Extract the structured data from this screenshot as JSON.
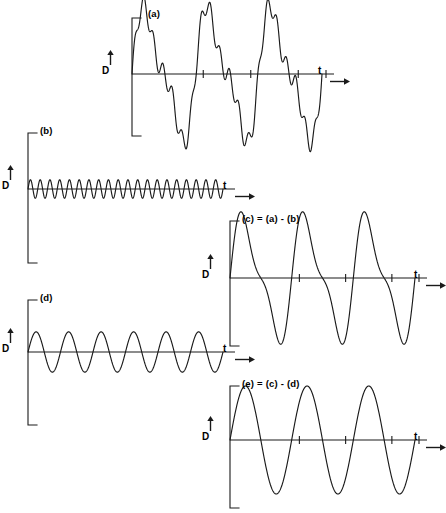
{
  "figure": {
    "type": "waveform-decomposition",
    "background_color": "#ffffff",
    "line_color": "#1a1a1a",
    "panel_count": 5
  },
  "axis_labels": {
    "vertical": "D",
    "horizontal": "t",
    "vertical_arrow": "up-arrow",
    "horizontal_arrow": "right-arrow"
  },
  "panels": [
    {
      "id": "a",
      "label": "(a)",
      "d_label": "D",
      "t_label": "t",
      "tick_count": 3
    },
    {
      "id": "b",
      "label": "(b)",
      "d_label": "D",
      "t_label": "t",
      "tick_count": 0
    },
    {
      "id": "c",
      "label": "(c) = (a) - (b)",
      "d_label": "D",
      "t_label": "t",
      "tick_count": 3
    },
    {
      "id": "d",
      "label": "(d)",
      "d_label": "D",
      "t_label": "t",
      "tick_count": 0
    },
    {
      "id": "e",
      "label": "(e) = (c) - (d)",
      "d_label": "D",
      "t_label": "t",
      "tick_count": 3
    }
  ],
  "chart_data": {
    "type": "line",
    "title": "",
    "xlabel": "t",
    "ylabel": "D",
    "grid": false,
    "legend": "none",
    "subplots": [
      {
        "id": "a",
        "title": "(a)",
        "description": "Composite waveform: sum of three sinusoidal components",
        "components": [
          {
            "cycles": 3,
            "amplitude": 1.0,
            "phase": 0.0
          },
          {
            "cycles": 6,
            "amplitude": 0.36,
            "phase": 0.0
          },
          {
            "cycles": 20,
            "amplitude": 0.16,
            "phase": 0.0
          }
        ],
        "amplitude_scale": 1.0,
        "xlim": [
          0,
          1
        ],
        "ylim": [
          -1.6,
          1.6
        ]
      },
      {
        "id": "b",
        "title": "(b)",
        "description": "High frequency component removed from (a)",
        "components": [
          {
            "cycles": 20,
            "amplitude": 0.16,
            "phase": 0.0
          }
        ],
        "amplitude_scale": 1.0,
        "xlim": [
          0,
          1
        ],
        "ylim": [
          -1.6,
          1.6
        ]
      },
      {
        "id": "c",
        "title": "(c) = (a) - (b)",
        "description": "Residual after subtracting high frequency component",
        "components": [
          {
            "cycles": 3,
            "amplitude": 1.0,
            "phase": 0.0
          },
          {
            "cycles": 6,
            "amplitude": 0.36,
            "phase": 0.0
          }
        ],
        "amplitude_scale": 1.0,
        "xlim": [
          0,
          1
        ],
        "ylim": [
          -1.6,
          1.6
        ]
      },
      {
        "id": "d",
        "title": "(d)",
        "description": "Medium frequency component removed from (c)",
        "components": [
          {
            "cycles": 6,
            "amplitude": 0.36,
            "phase": 0.0
          }
        ],
        "amplitude_scale": 1.0,
        "xlim": [
          0,
          1
        ],
        "ylim": [
          -1.6,
          1.6
        ]
      },
      {
        "id": "e",
        "title": "(e) = (c) - (d)",
        "description": "Final residual: pure low frequency sinusoid",
        "components": [
          {
            "cycles": 3,
            "amplitude": 1.0,
            "phase": 0.0
          }
        ],
        "amplitude_scale": 1.0,
        "xlim": [
          0,
          1
        ],
        "ylim": [
          -1.6,
          1.6
        ]
      }
    ]
  },
  "geometry": {
    "panels": [
      {
        "id": "a",
        "left": 118,
        "top": 8,
        "width": 230,
        "height": 130,
        "axis_x": 14,
        "baseline_y": 66,
        "plot_width": 190,
        "bracket_top": 10,
        "bracket_bottom": 128,
        "bracket_tick": 9,
        "amp_px": 58,
        "label_left": 30,
        "label_top": 0,
        "d_left": -16,
        "d_top": 58,
        "arrow_left": -12,
        "arrow_top": 42,
        "t_left": 200,
        "t_top": 58,
        "t_arrow_left": 212,
        "t_arrow_top": 64
      },
      {
        "id": "b",
        "left": 18,
        "top": 125,
        "width": 230,
        "height": 140,
        "axis_x": 10,
        "baseline_y": 64,
        "plot_width": 195,
        "bracket_top": 8,
        "bracket_bottom": 138,
        "bracket_tick": 9,
        "amp_px": 58,
        "label_left": 22,
        "label_top": 0,
        "d_left": -16,
        "d_top": 56,
        "arrow_left": -12,
        "arrow_top": 40,
        "t_left": 205,
        "t_top": 56,
        "t_arrow_left": 217,
        "t_arrow_top": 62
      },
      {
        "id": "c",
        "left": 218,
        "top": 213,
        "width": 225,
        "height": 135,
        "axis_x": 12,
        "baseline_y": 65,
        "plot_width": 185,
        "bracket_top": 8,
        "bracket_bottom": 133,
        "bracket_tick": 9,
        "amp_px": 56,
        "label_left": 24,
        "label_top": 0,
        "d_left": -16,
        "d_top": 57,
        "arrow_left": -12,
        "arrow_top": 41,
        "t_left": 196,
        "t_top": 57,
        "t_arrow_left": 208,
        "t_arrow_top": 63
      },
      {
        "id": "d",
        "left": 18,
        "top": 292,
        "width": 230,
        "height": 135,
        "axis_x": 10,
        "baseline_y": 60,
        "plot_width": 195,
        "bracket_top": 8,
        "bracket_bottom": 133,
        "bracket_tick": 9,
        "amp_px": 56,
        "label_left": 22,
        "label_top": 0,
        "d_left": -16,
        "d_top": 52,
        "arrow_left": -12,
        "arrow_top": 36,
        "t_left": 205,
        "t_top": 52,
        "t_arrow_left": 217,
        "t_arrow_top": 58
      },
      {
        "id": "e",
        "left": 218,
        "top": 378,
        "width": 225,
        "height": 132,
        "axis_x": 12,
        "baseline_y": 62,
        "plot_width": 185,
        "bracket_top": 8,
        "bracket_bottom": 130,
        "bracket_tick": 9,
        "amp_px": 54,
        "label_left": 24,
        "label_top": 0,
        "d_left": -16,
        "d_top": 54,
        "arrow_left": -12,
        "arrow_top": 38,
        "t_left": 196,
        "t_top": 54,
        "t_arrow_left": 208,
        "t_arrow_top": 60
      }
    ]
  }
}
